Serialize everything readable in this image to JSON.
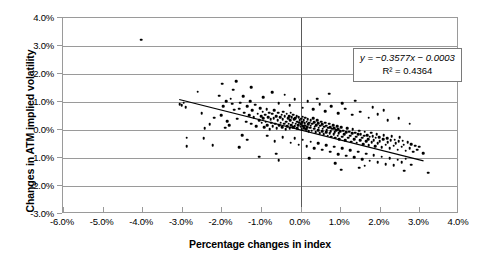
{
  "chart_data": {
    "type": "scatter",
    "title": "",
    "xlabel": "Percentage changes in index",
    "ylabel": "Changes in ATM implied volatility",
    "xlim": [
      -6.0,
      4.0
    ],
    "ylim": [
      -3.0,
      4.0
    ],
    "xtick_labels": [
      "-6.0%",
      "-5.0%",
      "-4.0%",
      "-3.0%",
      "-2.0%",
      "-1.0%",
      "0.0%",
      "1.0%",
      "2.0%",
      "3.0%",
      "4.0%"
    ],
    "xtick_values": [
      -6.0,
      -5.0,
      -4.0,
      -3.0,
      -2.0,
      -1.0,
      0.0,
      1.0,
      2.0,
      3.0,
      4.0
    ],
    "ytick_labels": [
      "4.0%",
      "3.0%",
      "2.0%",
      "1.0%",
      "0.0%",
      "-1.0%",
      "-2.0%",
      "-3.0%"
    ],
    "ytick_values": [
      4.0,
      3.0,
      2.0,
      1.0,
      0.0,
      -1.0,
      -2.0,
      -3.0
    ],
    "grid": "horizontal",
    "legend": "none",
    "marker_color": "#000000",
    "gridline_color": "#9a9a9a",
    "trendline": {
      "equation_text": "y = −0.3577x − 0.0003",
      "r2_text": "R² = 0.4364",
      "slope": -0.3577,
      "intercept": -0.0003,
      "r_squared": 0.4364,
      "x_start": -3.05,
      "x_end": 3.15,
      "color": "#000000"
    },
    "annotations": [
      {
        "name": "regression-equation",
        "text": "y = −0.3577x − 0.0003"
      },
      {
        "name": "r-squared",
        "text": "R² = 0.4364"
      }
    ],
    "points": [
      [
        -4.02,
        3.22
      ],
      [
        -3.05,
        0.93
      ],
      [
        -3.0,
        0.88
      ],
      [
        -2.95,
        0.97
      ],
      [
        -2.9,
        0.82
      ],
      [
        -2.88,
        -0.28
      ],
      [
        -2.6,
        1.37
      ],
      [
        -2.5,
        0.6
      ],
      [
        -2.42,
        0.06
      ],
      [
        -2.3,
        0.2
      ],
      [
        -2.22,
        -0.55
      ],
      [
        -2.05,
        1.22
      ],
      [
        -1.98,
        1.66
      ],
      [
        -1.95,
        0.86
      ],
      [
        -1.9,
        0.08
      ],
      [
        -1.85,
        0.32
      ],
      [
        -1.8,
        0.18
      ],
      [
        -1.76,
        1.12
      ],
      [
        -1.72,
        0.94
      ],
      [
        -1.68,
        0.72
      ],
      [
        -1.62,
        1.75
      ],
      [
        -1.6,
        0.4
      ],
      [
        -1.55,
        0.76
      ],
      [
        -1.52,
        0.98
      ],
      [
        -1.48,
        -0.18
      ],
      [
        -1.45,
        1.2
      ],
      [
        -1.42,
        0.62
      ],
      [
        -1.38,
        0.3
      ],
      [
        -1.35,
        0.84
      ],
      [
        -1.3,
        0.52
      ],
      [
        -1.28,
        1.02
      ],
      [
        -1.25,
        0.22
      ],
      [
        -1.22,
        0.7
      ],
      [
        -1.18,
        0.46
      ],
      [
        -1.15,
        0.9
      ],
      [
        -1.12,
        0.14
      ],
      [
        -1.08,
        0.58
      ],
      [
        -1.05,
        0.34
      ],
      [
        -1.02,
        0.78
      ],
      [
        -1.0,
        0.5
      ],
      [
        -0.98,
        0.26
      ],
      [
        -0.96,
        0.66
      ],
      [
        -0.94,
        0.42
      ],
      [
        -0.92,
        0.1
      ],
      [
        -0.9,
        0.54
      ],
      [
        -0.88,
        0.3
      ],
      [
        -0.86,
        0.74
      ],
      [
        -0.84,
        0.18
      ],
      [
        -0.82,
        0.46
      ],
      [
        -0.8,
        0.62
      ],
      [
        -0.78,
        0.02
      ],
      [
        -0.76,
        0.38
      ],
      [
        -0.74,
        0.26
      ],
      [
        -0.72,
        0.58
      ],
      [
        -0.7,
        0.14
      ],
      [
        -0.68,
        0.42
      ],
      [
        -0.66,
        0.7
      ],
      [
        -0.64,
        0.22
      ],
      [
        -0.62,
        0.5
      ],
      [
        -0.6,
        0.06
      ],
      [
        -0.58,
        0.34
      ],
      [
        -0.56,
        0.62
      ],
      [
        -0.54,
        0.18
      ],
      [
        -0.52,
        0.46
      ],
      [
        -0.5,
        0.26
      ],
      [
        -0.48,
        0.54
      ],
      [
        -0.46,
        0.1
      ],
      [
        -0.45,
        0.38
      ],
      [
        -0.44,
        0.66
      ],
      [
        -0.42,
        0.22
      ],
      [
        -0.4,
        0.5
      ],
      [
        -0.38,
        0.02
      ],
      [
        -0.36,
        0.3
      ],
      [
        -0.35,
        0.58
      ],
      [
        -0.34,
        0.14
      ],
      [
        -0.32,
        0.42
      ],
      [
        -0.3,
        0.22
      ],
      [
        -0.29,
        0.5
      ],
      [
        -0.28,
        0.06
      ],
      [
        -0.26,
        0.34
      ],
      [
        -0.25,
        0.62
      ],
      [
        -0.24,
        0.18
      ],
      [
        -0.22,
        0.46
      ],
      [
        -0.2,
        0.26
      ],
      [
        -0.19,
        0.54
      ],
      [
        -0.18,
        0.1
      ],
      [
        -0.16,
        0.38
      ],
      [
        -0.15,
        0.14
      ],
      [
        -0.14,
        0.42
      ],
      [
        -0.12,
        0.22
      ],
      [
        -0.1,
        0.5
      ],
      [
        -0.09,
        0.06
      ],
      [
        -0.08,
        0.3
      ],
      [
        -0.06,
        0.18
      ],
      [
        -0.05,
        0.46
      ],
      [
        -0.04,
        0.26
      ],
      [
        -0.02,
        0.34
      ],
      [
        0.0,
        0.12
      ],
      [
        0.01,
        0.4
      ],
      [
        0.02,
        0.2
      ],
      [
        0.03,
        0.02
      ],
      [
        0.04,
        0.28
      ],
      [
        0.05,
        0.48
      ],
      [
        0.06,
        0.14
      ],
      [
        0.08,
        0.34
      ],
      [
        0.09,
        0.06
      ],
      [
        0.1,
        0.24
      ],
      [
        0.11,
        0.44
      ],
      [
        0.12,
        0.16
      ],
      [
        0.14,
        0.02
      ],
      [
        0.15,
        0.3
      ],
      [
        0.16,
        0.1
      ],
      [
        0.18,
        0.38
      ],
      [
        0.19,
        0.2
      ],
      [
        0.2,
        -0.04
      ],
      [
        0.22,
        0.26
      ],
      [
        0.24,
        0.08
      ],
      [
        0.25,
        0.34
      ],
      [
        0.26,
        0.16
      ],
      [
        0.28,
        -0.02
      ],
      [
        0.3,
        0.22
      ],
      [
        0.32,
        0.42
      ],
      [
        0.34,
        0.04
      ],
      [
        0.35,
        0.28
      ],
      [
        0.36,
        0.12
      ],
      [
        0.38,
        -0.08
      ],
      [
        0.4,
        0.18
      ],
      [
        0.42,
        0.34
      ],
      [
        0.44,
        0.0
      ],
      [
        0.45,
        0.24
      ],
      [
        0.46,
        0.08
      ],
      [
        0.48,
        -0.12
      ],
      [
        0.5,
        0.16
      ],
      [
        0.52,
        0.3
      ],
      [
        0.54,
        -0.04
      ],
      [
        0.55,
        0.2
      ],
      [
        0.56,
        0.04
      ],
      [
        0.58,
        -0.16
      ],
      [
        0.6,
        0.12
      ],
      [
        0.62,
        0.26
      ],
      [
        0.64,
        -0.08
      ],
      [
        0.65,
        0.16
      ],
      [
        0.66,
        0.0
      ],
      [
        0.68,
        -0.2
      ],
      [
        0.7,
        0.08
      ],
      [
        0.72,
        0.22
      ],
      [
        0.74,
        -0.12
      ],
      [
        0.75,
        0.1
      ],
      [
        0.76,
        -0.04
      ],
      [
        0.78,
        -0.24
      ],
      [
        0.8,
        0.04
      ],
      [
        0.82,
        0.18
      ],
      [
        0.84,
        -0.16
      ],
      [
        0.85,
        0.06
      ],
      [
        0.86,
        -0.08
      ],
      [
        0.88,
        -0.28
      ],
      [
        0.9,
        0.0
      ],
      [
        0.92,
        0.14
      ],
      [
        0.94,
        -0.2
      ],
      [
        0.95,
        0.02
      ],
      [
        0.96,
        -0.12
      ],
      [
        0.98,
        -0.32
      ],
      [
        1.0,
        -0.04
      ],
      [
        1.02,
        0.1
      ],
      [
        1.05,
        -0.24
      ],
      [
        1.08,
        -0.02
      ],
      [
        1.1,
        -0.16
      ],
      [
        1.12,
        -0.36
      ],
      [
        1.15,
        -0.08
      ],
      [
        1.18,
        0.06
      ],
      [
        1.2,
        -0.28
      ],
      [
        1.22,
        -0.06
      ],
      [
        1.25,
        -0.2
      ],
      [
        1.28,
        -0.42
      ],
      [
        1.3,
        -0.12
      ],
      [
        1.32,
        0.02
      ],
      [
        1.35,
        -0.32
      ],
      [
        1.38,
        -0.1
      ],
      [
        1.4,
        -0.24
      ],
      [
        1.42,
        -0.46
      ],
      [
        1.45,
        -0.16
      ],
      [
        1.48,
        -0.02
      ],
      [
        1.5,
        -0.36
      ],
      [
        1.52,
        -0.14
      ],
      [
        1.55,
        -0.28
      ],
      [
        1.58,
        -0.5
      ],
      [
        1.6,
        -0.2
      ],
      [
        1.62,
        -0.06
      ],
      [
        1.65,
        -0.4
      ],
      [
        1.68,
        -0.18
      ],
      [
        1.7,
        -0.32
      ],
      [
        1.72,
        -0.54
      ],
      [
        1.75,
        -0.24
      ],
      [
        1.78,
        -0.1
      ],
      [
        1.8,
        -0.44
      ],
      [
        1.82,
        -0.22
      ],
      [
        1.85,
        -0.36
      ],
      [
        1.88,
        -0.58
      ],
      [
        1.9,
        -0.28
      ],
      [
        1.92,
        -0.14
      ],
      [
        1.95,
        -0.48
      ],
      [
        1.98,
        -0.26
      ],
      [
        2.0,
        -0.4
      ],
      [
        2.05,
        -0.62
      ],
      [
        2.08,
        -0.32
      ],
      [
        2.1,
        -0.18
      ],
      [
        2.15,
        -0.52
      ],
      [
        2.18,
        -0.3
      ],
      [
        2.2,
        -0.44
      ],
      [
        2.25,
        -0.66
      ],
      [
        2.28,
        -0.36
      ],
      [
        2.3,
        -0.22
      ],
      [
        2.35,
        -0.56
      ],
      [
        2.38,
        -0.34
      ],
      [
        2.4,
        -0.48
      ],
      [
        2.45,
        -0.7
      ],
      [
        2.48,
        -0.4
      ],
      [
        2.5,
        -0.26
      ],
      [
        2.55,
        -0.6
      ],
      [
        2.58,
        -0.38
      ],
      [
        2.6,
        -0.52
      ],
      [
        2.65,
        -0.74
      ],
      [
        2.7,
        -0.44
      ],
      [
        2.75,
        -0.64
      ],
      [
        2.8,
        -0.5
      ],
      [
        2.85,
        -0.78
      ],
      [
        2.9,
        -0.56
      ],
      [
        2.95,
        -0.7
      ],
      [
        3.0,
        -0.6
      ],
      [
        3.1,
        -0.82
      ],
      [
        3.22,
        -1.52
      ],
      [
        -2.88,
        -0.58
      ],
      [
        -2.45,
        -0.3
      ],
      [
        -1.55,
        -0.62
      ],
      [
        -1.35,
        -0.34
      ],
      [
        -0.85,
        -0.2
      ],
      [
        -0.65,
        -0.4
      ],
      [
        -0.45,
        -0.26
      ],
      [
        -0.25,
        -0.46
      ],
      [
        -0.15,
        -0.3
      ],
      [
        -0.05,
        -0.52
      ],
      [
        0.05,
        -0.34
      ],
      [
        0.15,
        -0.58
      ],
      [
        0.25,
        -0.42
      ],
      [
        0.35,
        -0.64
      ],
      [
        0.45,
        -0.48
      ],
      [
        0.55,
        -0.7
      ],
      [
        0.65,
        -0.54
      ],
      [
        0.75,
        -0.78
      ],
      [
        0.85,
        -0.6
      ],
      [
        0.95,
        -0.86
      ],
      [
        1.05,
        -0.66
      ],
      [
        1.15,
        -0.92
      ],
      [
        1.25,
        -0.72
      ],
      [
        1.35,
        -0.98
      ],
      [
        1.45,
        -0.78
      ],
      [
        1.55,
        -1.04
      ],
      [
        1.65,
        -0.84
      ],
      [
        1.75,
        -1.1
      ],
      [
        1.85,
        -0.9
      ],
      [
        1.95,
        -1.16
      ],
      [
        2.05,
        -0.96
      ],
      [
        2.15,
        -1.22
      ],
      [
        2.25,
        -1.0
      ],
      [
        2.35,
        -1.26
      ],
      [
        2.45,
        -1.06
      ],
      [
        2.55,
        -1.16
      ],
      [
        2.65,
        -1.02
      ],
      [
        2.8,
        -1.24
      ],
      [
        -1.05,
        -0.96
      ],
      [
        -0.55,
        -1.08
      ],
      [
        1.02,
        -1.42
      ],
      [
        1.48,
        -1.34
      ],
      [
        2.62,
        -1.46
      ],
      [
        -2.0,
        0.52
      ],
      [
        -1.7,
        1.44
      ],
      [
        -1.25,
        1.52
      ],
      [
        -0.95,
        1.18
      ],
      [
        -0.72,
        1.34
      ],
      [
        -0.55,
        0.96
      ],
      [
        -0.4,
        1.26
      ],
      [
        -0.28,
        0.88
      ],
      [
        -0.15,
        1.1
      ],
      [
        0.05,
        0.8
      ],
      [
        0.18,
        1.02
      ],
      [
        0.32,
        0.74
      ],
      [
        0.48,
        0.92
      ],
      [
        0.62,
        0.68
      ],
      [
        0.78,
        0.86
      ],
      [
        0.95,
        0.6
      ],
      [
        1.12,
        0.76
      ],
      [
        1.3,
        0.54
      ],
      [
        1.5,
        0.66
      ],
      [
        1.72,
        0.44
      ],
      [
        1.95,
        0.56
      ],
      [
        2.2,
        0.34
      ],
      [
        2.48,
        0.42
      ],
      [
        2.75,
        0.22
      ],
      [
        -0.62,
        -0.84
      ],
      [
        0.22,
        -1.0
      ],
      [
        0.88,
        -1.18
      ],
      [
        1.62,
        -1.28
      ],
      [
        -2.18,
        0.44
      ],
      [
        -1.88,
        1.02
      ],
      [
        0.42,
        1.12
      ],
      [
        0.72,
        1.3
      ],
      [
        1.05,
        0.96
      ],
      [
        1.38,
        1.04
      ],
      [
        1.82,
        0.82
      ],
      [
        2.1,
        0.7
      ]
    ]
  }
}
